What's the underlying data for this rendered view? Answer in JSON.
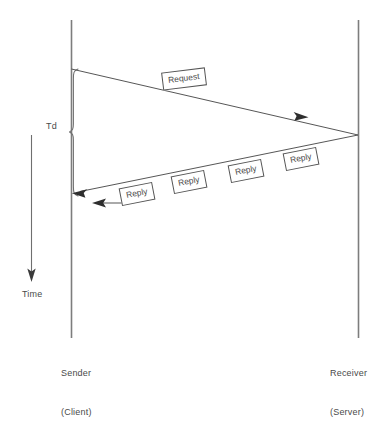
{
  "diagram": {
    "type": "sequence-timing",
    "colors": {
      "line": "#555555",
      "text": "#4a4a4a",
      "background": "#ffffff",
      "box_border": "#555555",
      "box_fill": "#ffffff"
    },
    "lifelines": [
      {
        "id": "sender",
        "name_line1": "Sender",
        "name_line2": "(Client)",
        "x": 71,
        "y_top": 20,
        "y_bottom": 338
      },
      {
        "id": "receiver",
        "name_line1": "Receiver",
        "name_line2": "(Server)",
        "x": 358,
        "y_top": 20,
        "y_bottom": 338
      }
    ],
    "time_axis": {
      "label": "Time",
      "x": 31,
      "y_start": 135,
      "y_end": 280,
      "direction": "downward"
    },
    "duration_marker": {
      "label": "Td",
      "brace_x": 73,
      "y_top": 69,
      "y_bottom": 196,
      "y_mid": 132
    },
    "messages": [
      {
        "id": "request",
        "label": "Request",
        "direction": "sender-to-receiver",
        "from_x": 71,
        "from_y": 69,
        "to_x": 358,
        "to_y": 135,
        "arrowhead_x": 303,
        "arrowhead_y": 117
      },
      {
        "id": "reply-stream",
        "label": "Reply",
        "direction": "receiver-to-sender",
        "from_x": 358,
        "from_y": 135,
        "to_x": 73,
        "to_y": 193,
        "count": 4
      },
      {
        "id": "reply-last",
        "label": "Reply",
        "direction": "receiver-to-sender",
        "from_x": 123,
        "from_y": 203,
        "to_x": 92,
        "to_y": 203
      }
    ],
    "reply_labels": [
      {
        "text": "Reply",
        "x": 120,
        "y": 185
      },
      {
        "text": "Reply",
        "x": 172,
        "y": 173
      },
      {
        "text": "Reply",
        "x": 229,
        "y": 162
      },
      {
        "text": "Reply",
        "x": 284,
        "y": 150
      }
    ]
  }
}
